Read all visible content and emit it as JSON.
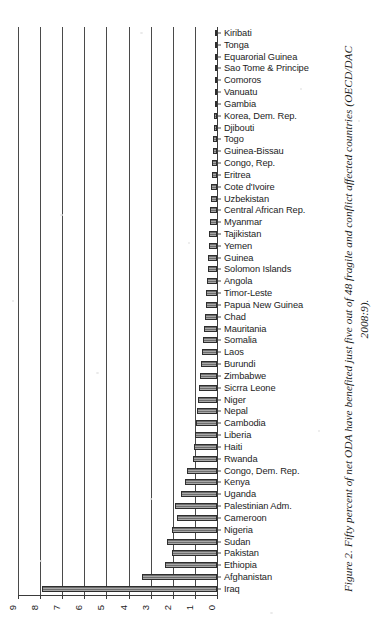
{
  "figure": {
    "caption": "Figure 2. Fifty percent of net ODA have benefited just five out of 48 fragile and conflict affected countries (OECD/DAC 2008:9)."
  },
  "chart_data": {
    "type": "bar",
    "orientation": "horizontal",
    "title": "",
    "xlabel": "",
    "ylabel": "",
    "xlim": [
      9,
      0
    ],
    "x_axis_reversed": true,
    "grid": true,
    "legend": false,
    "tick_labels": [
      "9",
      "8",
      "7",
      "6",
      "5",
      "4",
      "3",
      "2",
      "1",
      "0"
    ],
    "tick_values": [
      9,
      8,
      7,
      6,
      5,
      4,
      3,
      2,
      1,
      0
    ],
    "categories": [
      "Kiribati",
      "Tonga",
      "Equarorial Guinea",
      "Sao Tome & Principe",
      "Comoros",
      "Vanuatu",
      "Gambia",
      "Korea, Dem. Rep.",
      "Djibouti",
      "Togo",
      "Guinea-Bissau",
      "Congo, Rep.",
      "Eritrea",
      "Cote d'Ivoire",
      "Uzbekistan",
      "Central African Rep.",
      "Myanmar",
      "Tajikistan",
      "Yemen",
      "Guinea",
      "Solomon Islands",
      "Angola",
      "Timor-Leste",
      "Papua New Guinea",
      "Chad",
      "Mauritania",
      "Somalia",
      "Laos",
      "Burundi",
      "Zimbabwe",
      "Sicrra Leone",
      "Niger",
      "Nepal",
      "Cambodia",
      "Liberia",
      "Haiti",
      "Rwanda",
      "Congo, Dem. Rep.",
      "Kenya",
      "Uganda",
      "Palestinian Adm.",
      "Cameroon",
      "Nigeria",
      "Sudan",
      "Pakistan",
      "Ethiopia",
      "Afghanistan",
      "Iraq"
    ],
    "values": [
      0.05,
      0.06,
      0.07,
      0.08,
      0.09,
      0.1,
      0.11,
      0.13,
      0.15,
      0.17,
      0.19,
      0.21,
      0.23,
      0.25,
      0.27,
      0.3,
      0.32,
      0.35,
      0.37,
      0.4,
      0.43,
      0.46,
      0.49,
      0.52,
      0.56,
      0.6,
      0.64,
      0.68,
      0.72,
      0.76,
      0.82,
      0.86,
      0.9,
      0.95,
      1.0,
      1.05,
      1.1,
      1.35,
      1.45,
      1.65,
      1.9,
      1.8,
      2.05,
      2.25,
      2.05,
      2.35,
      3.4,
      7.9
    ]
  }
}
